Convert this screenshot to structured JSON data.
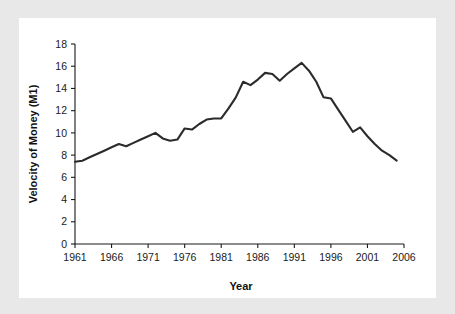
{
  "figure": {
    "background_color": "#e8e8e8",
    "panel_color": "#ffffff",
    "line_color": "#2b2b2b"
  },
  "chart_data": {
    "type": "line",
    "title": "",
    "xlabel": "Year",
    "ylabel": "Velocity of Money (M1)",
    "xlim": [
      1961,
      2006
    ],
    "ylim": [
      0,
      18
    ],
    "grid": false,
    "legend": "none",
    "xticks": [
      1961,
      1966,
      1971,
      1976,
      1981,
      1986,
      1991,
      1996,
      2001,
      2006
    ],
    "yticks": [
      0,
      2,
      4,
      6,
      8,
      10,
      12,
      14,
      16,
      18
    ],
    "xtick_labels": [
      "1961",
      "1966",
      "1971",
      "1976",
      "1981",
      "1986",
      "1991",
      "1996",
      "2001",
      "2006"
    ],
    "ytick_labels": [
      "0",
      "2",
      "4",
      "6",
      "8",
      "10",
      "12",
      "14",
      "16",
      "18"
    ],
    "series": [
      {
        "name": "Velocity of Money (M1)",
        "x": [
          1961,
          1962,
          1963,
          1964,
          1965,
          1966,
          1967,
          1968,
          1969,
          1970,
          1971,
          1972,
          1973,
          1974,
          1975,
          1976,
          1977,
          1978,
          1979,
          1980,
          1981,
          1982,
          1983,
          1984,
          1985,
          1986,
          1987,
          1988,
          1989,
          1990,
          1991,
          1992,
          1993,
          1994,
          1995,
          1996,
          1997,
          1998,
          1999,
          2000,
          2001,
          2002,
          2003,
          2004,
          2005
        ],
        "values": [
          7.4,
          7.5,
          7.8,
          8.1,
          8.4,
          8.7,
          9.0,
          8.8,
          9.1,
          9.4,
          9.7,
          10.0,
          9.5,
          9.3,
          9.4,
          10.4,
          10.3,
          10.8,
          11.2,
          11.3,
          11.3,
          12.2,
          13.2,
          14.6,
          14.3,
          14.8,
          15.4,
          15.3,
          14.7,
          15.3,
          15.8,
          16.3,
          15.6,
          14.6,
          13.2,
          13.1,
          12.1,
          11.1,
          10.1,
          10.5,
          9.7,
          9.0,
          8.4,
          8.0,
          7.5
        ]
      }
    ]
  }
}
